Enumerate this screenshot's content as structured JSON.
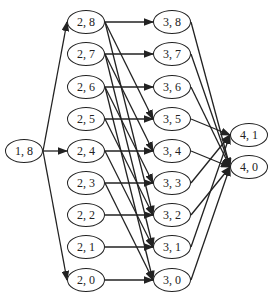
{
  "nodes": [
    {
      "id": "1,8",
      "label": "1, 8",
      "x": 24,
      "y": 151
    },
    {
      "id": "2,8",
      "label": "2, 8",
      "x": 86,
      "y": 22
    },
    {
      "id": "2,7",
      "label": "2, 7",
      "x": 86,
      "y": 54
    },
    {
      "id": "2,6",
      "label": "2, 6",
      "x": 86,
      "y": 87
    },
    {
      "id": "2,5",
      "label": "2, 5",
      "x": 86,
      "y": 119
    },
    {
      "id": "2,4",
      "label": "2, 4",
      "x": 86,
      "y": 151
    },
    {
      "id": "2,3",
      "label": "2, 3",
      "x": 86,
      "y": 183
    },
    {
      "id": "2,2",
      "label": "2, 2",
      "x": 86,
      "y": 215
    },
    {
      "id": "2,1",
      "label": "2, 1",
      "x": 86,
      "y": 247
    },
    {
      "id": "2,0",
      "label": "2, 0",
      "x": 86,
      "y": 280
    },
    {
      "id": "3,8",
      "label": "3, 8",
      "x": 172,
      "y": 22
    },
    {
      "id": "3,7",
      "label": "3, 7",
      "x": 172,
      "y": 54
    },
    {
      "id": "3,6",
      "label": "3, 6",
      "x": 172,
      "y": 87
    },
    {
      "id": "3,5",
      "label": "3, 5",
      "x": 172,
      "y": 119
    },
    {
      "id": "3,4",
      "label": "3, 4",
      "x": 172,
      "y": 151
    },
    {
      "id": "3,3",
      "label": "3, 3",
      "x": 172,
      "y": 183
    },
    {
      "id": "3,2",
      "label": "3, 2",
      "x": 172,
      "y": 215
    },
    {
      "id": "3,1",
      "label": "3, 1",
      "x": 172,
      "y": 247
    },
    {
      "id": "3,0",
      "label": "3, 0",
      "x": 172,
      "y": 280
    },
    {
      "id": "4,1",
      "label": "4, 1",
      "x": 249,
      "y": 135
    },
    {
      "id": "4,0",
      "label": "4, 0",
      "x": 249,
      "y": 167
    }
  ],
  "edges": [
    [
      "1,8",
      "2,8"
    ],
    [
      "1,8",
      "2,4"
    ],
    [
      "1,8",
      "2,0"
    ],
    [
      "2,8",
      "3,8"
    ],
    [
      "2,8",
      "3,5"
    ],
    [
      "2,8",
      "3,2"
    ],
    [
      "2,7",
      "3,7"
    ],
    [
      "2,7",
      "3,4"
    ],
    [
      "2,7",
      "3,1"
    ],
    [
      "2,6",
      "3,6"
    ],
    [
      "2,6",
      "3,3"
    ],
    [
      "2,6",
      "3,0"
    ],
    [
      "2,5",
      "3,5"
    ],
    [
      "2,5",
      "3,2"
    ],
    [
      "2,4",
      "3,4"
    ],
    [
      "2,4",
      "3,1"
    ],
    [
      "2,3",
      "3,3"
    ],
    [
      "2,3",
      "3,0"
    ],
    [
      "2,2",
      "3,2"
    ],
    [
      "2,1",
      "3,1"
    ],
    [
      "2,0",
      "3,0"
    ],
    [
      "3,8",
      "4,0"
    ],
    [
      "3,7",
      "4,0"
    ],
    [
      "3,6",
      "4,0"
    ],
    [
      "3,5",
      "4,1"
    ],
    [
      "3,4",
      "4,0"
    ],
    [
      "3,3",
      "4,1"
    ],
    [
      "3,2",
      "4,0"
    ],
    [
      "3,1",
      "4,1"
    ],
    [
      "3,0",
      "4,0"
    ]
  ]
}
